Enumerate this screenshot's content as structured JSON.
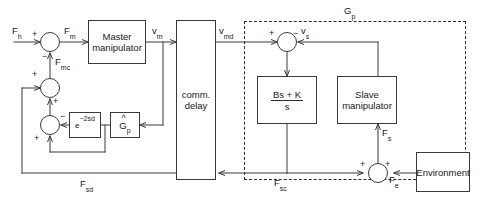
{
  "diagram": {
    "blocks": {
      "master": {
        "line1": "Master",
        "line2": "manipulator"
      },
      "comm_delay": {
        "line1": "comm.",
        "line2": "delay"
      },
      "delay_exp": {
        "base": "e",
        "exponent": "−2sd"
      },
      "gp_hat": {
        "hat": "^",
        "base": "G",
        "sub": "p"
      },
      "impedance": {
        "numerator": "Bs + K",
        "denominator": "s"
      },
      "slave": {
        "line1": "Slave",
        "line2": "manipulator"
      },
      "environment": {
        "label": "Environment"
      }
    },
    "group_label": {
      "base": "G",
      "sub": "p"
    },
    "signals": {
      "f_h": {
        "base": "F",
        "sub": "h"
      },
      "f_m": {
        "base": "F",
        "sub": "m"
      },
      "f_mc": {
        "base": "F",
        "sub": "mc"
      },
      "v_m": {
        "base": "v",
        "sub": "m"
      },
      "v_md": {
        "base": "v",
        "sub": "md"
      },
      "v_s": {
        "base": "v",
        "sub": "s"
      },
      "f_s": {
        "base": "F",
        "sub": "s"
      },
      "f_e": {
        "base": "F",
        "sub": "e"
      },
      "f_sd": {
        "base": "F",
        "sub": "sd"
      },
      "f_sc": {
        "base": "F",
        "sub": "sc"
      }
    },
    "signs": {
      "sum1_in_left": "+",
      "sum1_in_bottom": "−",
      "sum2_in_left": "+",
      "sum2_in_bottom": "+",
      "sum3_in_right": "−",
      "sum3_in_bottom": "+",
      "sum4_in_left": "+",
      "sum4_in_right": "−",
      "sum5_in_left": "+",
      "sum5_in_right": "+"
    },
    "colors": {
      "stroke": "#3a3a3a",
      "dashed": "#2b2b2b",
      "text": "#1a1a1a",
      "background": "#ffffff"
    }
  }
}
